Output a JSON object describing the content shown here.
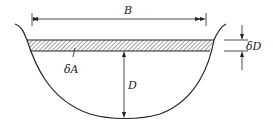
{
  "diagram": {
    "type": "channel-cross-section",
    "labels": {
      "top_width": "B",
      "strip_thickness": "δD",
      "strip_area": "δA",
      "depth": "D"
    },
    "colors": {
      "stroke": "#222222",
      "hatch": "#444444",
      "background": "#ffffff"
    }
  }
}
